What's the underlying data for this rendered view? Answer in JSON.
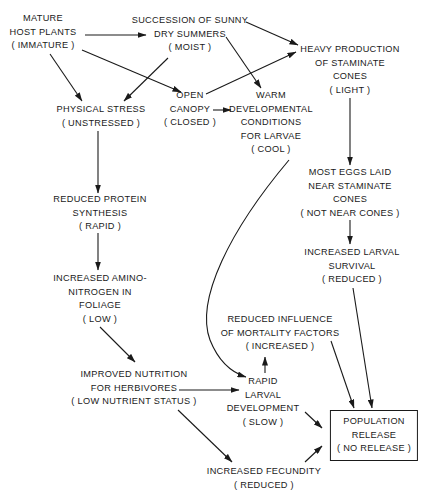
{
  "diagram": {
    "nodes": {
      "mature_host": {
        "lines": [
          "MATURE",
          "HOST PLANTS",
          "( IMMATURE )"
        ]
      },
      "sunny_summers": {
        "lines": [
          "SUCCESSION OF SUNNY",
          "DRY  SUMMERS",
          "( MOIST )"
        ]
      },
      "staminate_cones": {
        "lines": [
          "HEAVY PRODUCTION",
          "OF STAMINATE",
          "CONES",
          "( LIGHT )"
        ]
      },
      "physical_stress": {
        "lines": [
          "PHYSICAL STRESS",
          "( UNSTRESSED )"
        ]
      },
      "open_canopy": {
        "lines": [
          "OPEN",
          "CANOPY",
          "( CLOSED )"
        ]
      },
      "warm_conditions": {
        "lines": [
          "WARM",
          "DEVELOPMENTAL",
          "CONDITIONS",
          "FOR LARVAE",
          "( COOL )"
        ]
      },
      "eggs_laid": {
        "lines": [
          "MOST EGGS LAID",
          "NEAR STAMINATE",
          "CONES",
          "( NOT NEAR CONES  )"
        ]
      },
      "protein_synthesis": {
        "lines": [
          "REDUCED PROTEIN",
          "SYNTHESIS",
          "( RAPID )"
        ]
      },
      "larval_survival": {
        "lines": [
          "INCREASED LARVAL",
          "SURVIVAL",
          "( REDUCED )"
        ]
      },
      "amino_nitrogen": {
        "lines": [
          "INCREASED AMINO-",
          "NITROGEN IN",
          "FOLIAGE",
          "( LOW )"
        ]
      },
      "mortality_factors": {
        "lines": [
          "REDUCED INFLUENCE",
          "OF MORTALITY FACTORS",
          "( INCREASED )"
        ]
      },
      "improved_nutrition": {
        "lines": [
          "IMPROVED NUTRITION",
          "FOR HERBIVORES",
          "( LOW NUTRIENT STATUS )"
        ]
      },
      "rapid_larval": {
        "lines": [
          "RAPID",
          "LARVAL",
          "DEVELOPMENT",
          "( SLOW )"
        ]
      },
      "population_release": {
        "lines": [
          "POPULATION",
          "RELEASE",
          "( NO RELEASE )"
        ]
      },
      "fecundity": {
        "lines": [
          "INCREASED FECUNDITY",
          "( REDUCED )"
        ]
      }
    },
    "edges": [
      [
        "mature_host",
        "sunny_summers"
      ],
      [
        "mature_host",
        "physical_stress"
      ],
      [
        "mature_host",
        "open_canopy"
      ],
      [
        "sunny_summers",
        "physical_stress"
      ],
      [
        "sunny_summers",
        "staminate_cones"
      ],
      [
        "sunny_summers",
        "warm_conditions"
      ],
      [
        "open_canopy",
        "staminate_cones"
      ],
      [
        "open_canopy",
        "warm_conditions"
      ],
      [
        "staminate_cones",
        "eggs_laid"
      ],
      [
        "physical_stress",
        "protein_synthesis"
      ],
      [
        "protein_synthesis",
        "amino_nitrogen"
      ],
      [
        "eggs_laid",
        "larval_survival"
      ],
      [
        "amino_nitrogen",
        "improved_nutrition"
      ],
      [
        "warm_conditions",
        "rapid_larval"
      ],
      [
        "rapid_larval",
        "mortality_factors"
      ],
      [
        "improved_nutrition",
        "rapid_larval"
      ],
      [
        "improved_nutrition",
        "fecundity"
      ],
      [
        "mortality_factors",
        "population_release"
      ],
      [
        "larval_survival",
        "population_release"
      ],
      [
        "rapid_larval",
        "population_release"
      ],
      [
        "fecundity",
        "population_release"
      ]
    ]
  }
}
